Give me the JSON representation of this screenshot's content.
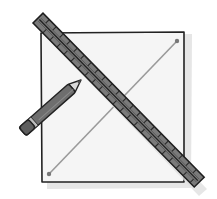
{
  "illustration": {
    "description": "Square with diagonal line drawn using a ruler and pencil",
    "colors": {
      "background": "#ffffff",
      "paper": "#f4f4f4",
      "shadow": "#e2e2e2",
      "outline": "#222222",
      "ruler_fill": "#7a7a7a",
      "ruler_dark": "#444444",
      "pencil_body": "#6e6e6e",
      "pencil_band": "#bdbdbd",
      "diagonal_line": "#9a9a9a",
      "dot": "#777777"
    },
    "labels": {
      "square": "square-paper",
      "ruler": "ruler",
      "pencil": "pencil",
      "diagonal": "diagonal-line"
    }
  }
}
